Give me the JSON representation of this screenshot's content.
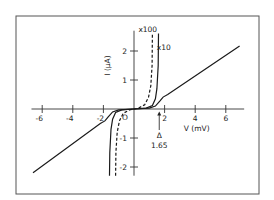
{
  "chart_data": {
    "type": "line",
    "title": "",
    "xlabel": "V (mV)",
    "ylabel": "I (μA)",
    "xlim": [
      -7,
      7.5
    ],
    "ylim": [
      -2.3,
      2.6
    ],
    "xticks": [
      -6,
      -4,
      -2,
      2,
      4,
      6
    ],
    "xtick_labels": [
      "-6",
      "-4",
      "-2",
      "2",
      "4",
      "6"
    ],
    "yticks": [
      -2,
      -1,
      1,
      2
    ],
    "ytick_labels": [
      "-2",
      "-1",
      "1",
      "2"
    ],
    "origin_label": "O",
    "grid": false,
    "series": [
      {
        "name": "I-V (x1)",
        "style": "solid",
        "x": [
          -6.6,
          -2.2,
          -1.9,
          -1.7,
          -1.4,
          -1.0,
          0,
          1.0,
          1.4,
          1.7,
          1.9,
          2.2,
          6.9
        ],
        "y": [
          -2.2,
          -0.5,
          -0.41,
          -0.28,
          -0.1,
          -0.03,
          0,
          0.03,
          0.1,
          0.28,
          0.41,
          0.5,
          2.17
        ]
      },
      {
        "name": "x10",
        "style": "solid",
        "x": [
          -1.6,
          -1.58,
          -1.5,
          -1.4,
          -1.2,
          -0.8,
          0,
          0.8,
          1.2,
          1.4,
          1.5,
          1.58,
          1.6
        ],
        "y": [
          -2.3,
          -1.5,
          -0.7,
          -0.35,
          -0.12,
          -0.03,
          0,
          0.03,
          0.12,
          0.35,
          0.7,
          1.5,
          2.6
        ]
      },
      {
        "name": "x100",
        "style": "dashed",
        "x": [
          -1.2,
          -1.18,
          -1.1,
          -0.95,
          -0.7,
          -0.3,
          0,
          0.3,
          0.7,
          0.95,
          1.1,
          1.18,
          1.2
        ],
        "y": [
          -2.3,
          -1.5,
          -0.8,
          -0.4,
          -0.15,
          -0.03,
          0,
          0.03,
          0.15,
          0.4,
          0.8,
          1.5,
          2.6
        ]
      }
    ],
    "annotations": [
      {
        "text": "x100",
        "x": 0.9,
        "y": 2.65
      },
      {
        "text": "x10",
        "x": 1.95,
        "y": 2.05
      },
      {
        "text": "Δ",
        "x": 1.65,
        "y": -1.0,
        "arrow_to": [
          1.65,
          -0.05
        ]
      },
      {
        "text": "1.65",
        "x": 1.65,
        "y": -1.35
      }
    ]
  }
}
